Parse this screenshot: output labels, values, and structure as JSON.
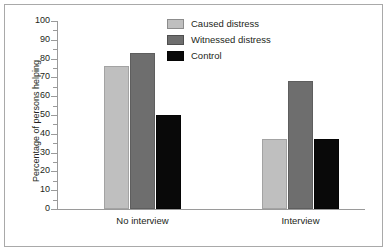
{
  "chart_data": {
    "type": "bar",
    "title": "",
    "xlabel": "",
    "ylabel": "Percentage of persons helping",
    "categories": [
      "No interview",
      "Interview"
    ],
    "series": [
      {
        "name": "Caused distress",
        "color": "#bfbfbf",
        "values": [
          76,
          37
        ]
      },
      {
        "name": "Witnessed distress",
        "color": "#6e6e6e",
        "values": [
          83,
          68
        ]
      },
      {
        "name": "Control",
        "color": "#090909",
        "values": [
          50,
          37
        ]
      }
    ],
    "ylim": [
      0,
      100
    ],
    "ytick_labels": [
      "100",
      "90",
      "80",
      "70",
      "60",
      "50",
      "40",
      "30",
      "20",
      "10",
      "0"
    ],
    "ytick_values": [
      100,
      90,
      80,
      70,
      60,
      50,
      40,
      30,
      20,
      10,
      0
    ],
    "minor_ticks": true,
    "minor_tick_step": 5,
    "grid": false,
    "legend_position": "top-center"
  },
  "legend": {
    "items": [
      {
        "label": "Caused distress"
      },
      {
        "label": "Witnessed distress"
      },
      {
        "label": "Control"
      }
    ]
  },
  "axis": {
    "y_title": "Percentage of persons helping"
  }
}
